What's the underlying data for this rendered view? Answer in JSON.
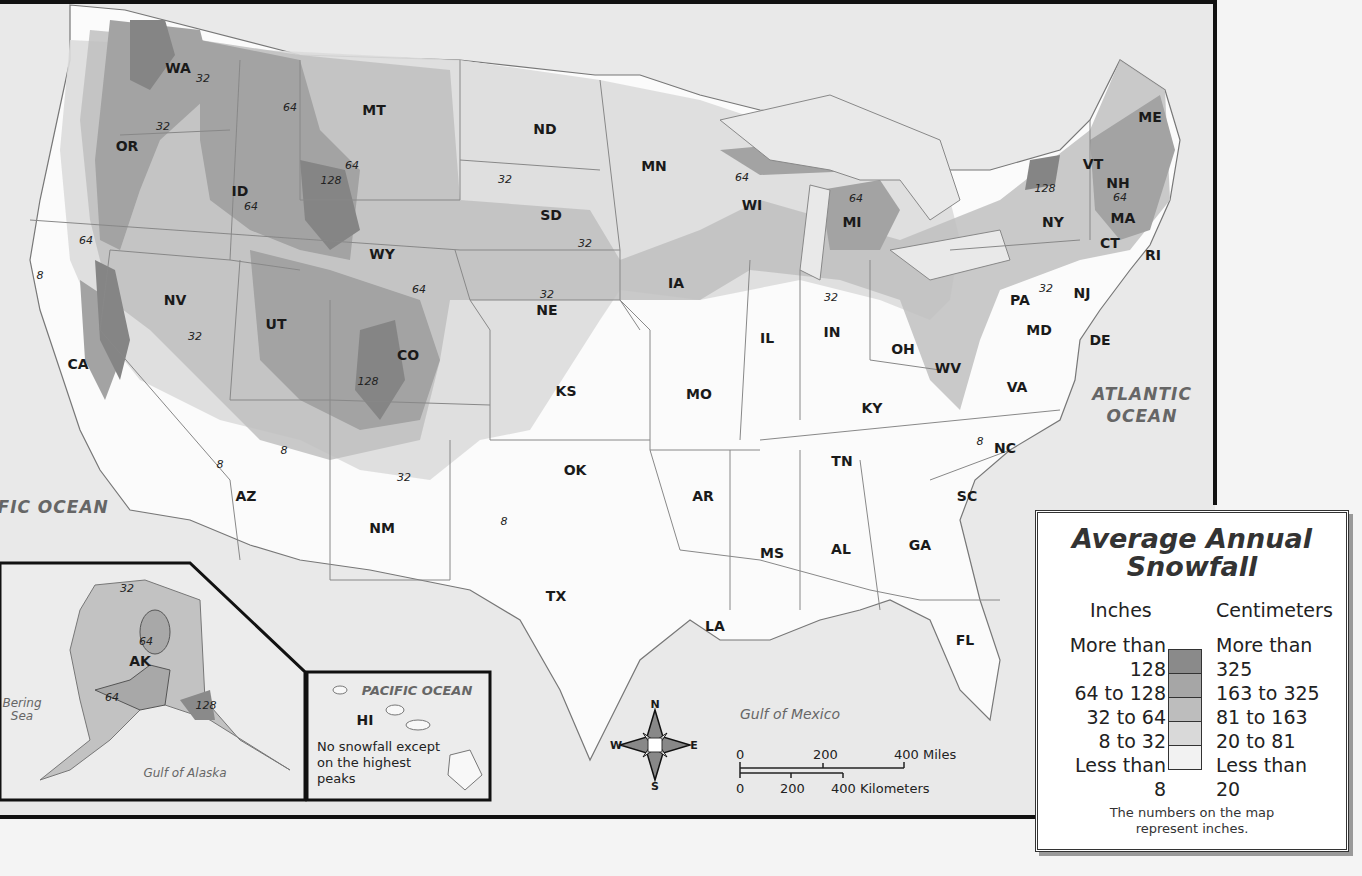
{
  "map": {
    "title": "Average Annual Snowfall",
    "states": [
      {
        "code": "WA",
        "x": 178,
        "y": 68
      },
      {
        "code": "OR",
        "x": 127,
        "y": 146
      },
      {
        "code": "ID",
        "x": 240,
        "y": 191
      },
      {
        "code": "MT",
        "x": 374,
        "y": 110
      },
      {
        "code": "WY",
        "x": 382,
        "y": 254
      },
      {
        "code": "NV",
        "x": 175,
        "y": 300
      },
      {
        "code": "CA",
        "x": 78,
        "y": 364
      },
      {
        "code": "UT",
        "x": 276,
        "y": 324
      },
      {
        "code": "CO",
        "x": 408,
        "y": 355
      },
      {
        "code": "AZ",
        "x": 246,
        "y": 496
      },
      {
        "code": "NM",
        "x": 382,
        "y": 528
      },
      {
        "code": "ND",
        "x": 545,
        "y": 129
      },
      {
        "code": "SD",
        "x": 551,
        "y": 215
      },
      {
        "code": "NE",
        "x": 547,
        "y": 310
      },
      {
        "code": "KS",
        "x": 566,
        "y": 391
      },
      {
        "code": "OK",
        "x": 575,
        "y": 470
      },
      {
        "code": "TX",
        "x": 556,
        "y": 596
      },
      {
        "code": "MN",
        "x": 654,
        "y": 166
      },
      {
        "code": "IA",
        "x": 676,
        "y": 283
      },
      {
        "code": "MO",
        "x": 699,
        "y": 394
      },
      {
        "code": "AR",
        "x": 703,
        "y": 496
      },
      {
        "code": "LA",
        "x": 715,
        "y": 626
      },
      {
        "code": "WI",
        "x": 752,
        "y": 205
      },
      {
        "code": "IL",
        "x": 767,
        "y": 338
      },
      {
        "code": "MI",
        "x": 852,
        "y": 222
      },
      {
        "code": "IN",
        "x": 832,
        "y": 332
      },
      {
        "code": "OH",
        "x": 903,
        "y": 349
      },
      {
        "code": "KY",
        "x": 872,
        "y": 408
      },
      {
        "code": "TN",
        "x": 842,
        "y": 461
      },
      {
        "code": "MS",
        "x": 772,
        "y": 553
      },
      {
        "code": "AL",
        "x": 841,
        "y": 549
      },
      {
        "code": "GA",
        "x": 920,
        "y": 545
      },
      {
        "code": "FL",
        "x": 965,
        "y": 640
      },
      {
        "code": "SC",
        "x": 967,
        "y": 496
      },
      {
        "code": "NC",
        "x": 1005,
        "y": 448
      },
      {
        "code": "VA",
        "x": 1017,
        "y": 387
      },
      {
        "code": "WV",
        "x": 948,
        "y": 368
      },
      {
        "code": "MD",
        "x": 1039,
        "y": 330
      },
      {
        "code": "DE",
        "x": 1100,
        "y": 340
      },
      {
        "code": "PA",
        "x": 1020,
        "y": 300
      },
      {
        "code": "NJ",
        "x": 1082,
        "y": 293
      },
      {
        "code": "NY",
        "x": 1053,
        "y": 222
      },
      {
        "code": "VT",
        "x": 1093,
        "y": 164
      },
      {
        "code": "NH",
        "x": 1118,
        "y": 183
      },
      {
        "code": "ME",
        "x": 1150,
        "y": 117
      },
      {
        "code": "MA",
        "x": 1123,
        "y": 218
      },
      {
        "code": "CT",
        "x": 1110,
        "y": 243
      },
      {
        "code": "RI",
        "x": 1153,
        "y": 255
      },
      {
        "code": "AK",
        "x": 140,
        "y": 661
      },
      {
        "code": "HI",
        "x": 365,
        "y": 720
      }
    ],
    "isolines": [
      {
        "v": "32",
        "x": 203,
        "y": 78
      },
      {
        "v": "32",
        "x": 163,
        "y": 126
      },
      {
        "v": "64",
        "x": 290,
        "y": 107
      },
      {
        "v": "64",
        "x": 352,
        "y": 165
      },
      {
        "v": "128",
        "x": 331,
        "y": 180
      },
      {
        "v": "64",
        "x": 251,
        "y": 206
      },
      {
        "v": "64",
        "x": 86,
        "y": 240
      },
      {
        "v": "8",
        "x": 40,
        "y": 275
      },
      {
        "v": "64",
        "x": 419,
        "y": 289
      },
      {
        "v": "32",
        "x": 195,
        "y": 336
      },
      {
        "v": "128",
        "x": 368,
        "y": 381
      },
      {
        "v": "8",
        "x": 220,
        "y": 464
      },
      {
        "v": "8",
        "x": 284,
        "y": 450
      },
      {
        "v": "32",
        "x": 404,
        "y": 477
      },
      {
        "v": "8",
        "x": 504,
        "y": 521
      },
      {
        "v": "32",
        "x": 505,
        "y": 179
      },
      {
        "v": "32",
        "x": 585,
        "y": 243
      },
      {
        "v": "32",
        "x": 547,
        "y": 294
      },
      {
        "v": "64",
        "x": 742,
        "y": 177
      },
      {
        "v": "64",
        "x": 856,
        "y": 198
      },
      {
        "v": "32",
        "x": 831,
        "y": 297
      },
      {
        "v": "128",
        "x": 1045,
        "y": 188
      },
      {
        "v": "64",
        "x": 1120,
        "y": 197
      },
      {
        "v": "32",
        "x": 1046,
        "y": 288
      },
      {
        "v": "8",
        "x": 980,
        "y": 441
      },
      {
        "v": "32",
        "x": 127,
        "y": 588
      },
      {
        "v": "64",
        "x": 146,
        "y": 641
      },
      {
        "v": "64",
        "x": 112,
        "y": 697
      },
      {
        "v": "128",
        "x": 206,
        "y": 705
      }
    ],
    "water": {
      "pacific": "PACIFIC\nOCEAN",
      "atlantic": "ATLANTIC\nOCEAN",
      "gulf_mexico": "Gulf of Mexico",
      "gulf_alaska": "Gulf of Alaska",
      "bering": "Bering\nSea",
      "pacific_inset": "PACIFIC OCEAN"
    },
    "hawaii_note": "No snowfall except on the highest peaks",
    "compass": {
      "n": "N",
      "s": "S",
      "e": "E",
      "w": "W"
    },
    "scale": {
      "miles": [
        "0",
        "200",
        "400 Miles"
      ],
      "km": [
        "0",
        "200",
        "400 Kilometers"
      ]
    }
  },
  "legend": {
    "title_line1": "Average Annual",
    "title_line2": "Snowfall",
    "inches_header": "Inches",
    "cm_header": "Centimeters",
    "classes": [
      {
        "inches": "More than 128",
        "cm": "More than 325",
        "color": "#8a8a8a"
      },
      {
        "inches": "64 to 128",
        "cm": "163 to 325",
        "color": "#a6a6a6"
      },
      {
        "inches": "32 to 64",
        "cm": "81 to 163",
        "color": "#bdbdbd"
      },
      {
        "inches": "8 to 32",
        "cm": "20 to 81",
        "color": "#d9d9d9"
      },
      {
        "inches": "Less than 8",
        "cm": "Less than 20",
        "color": "#f2f2f2"
      }
    ],
    "inches_rows": [
      "More than",
      "128",
      "64 to 128",
      "32 to 64",
      "8 to 32",
      "Less than",
      "8"
    ],
    "cm_rows": [
      "More than",
      "325",
      "163 to 325",
      "81 to 163",
      "20 to 81",
      "Less than",
      "20"
    ],
    "note": "The numbers on the map represent inches."
  }
}
